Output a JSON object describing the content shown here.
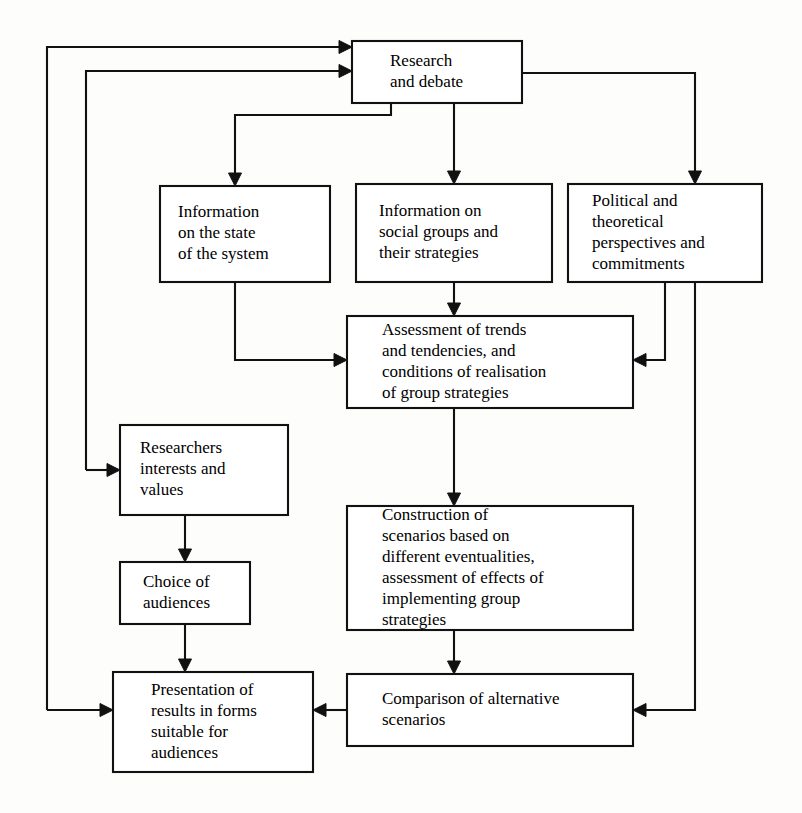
{
  "diagram": {
    "type": "flowchart",
    "background_color": "#fdfdfb",
    "line_color": "#111111",
    "box_fill_color": "#ffffff",
    "nodes": [
      {
        "id": "research",
        "name": "research-and-debate",
        "lines": [
          "Research",
          "and debate"
        ],
        "x": 352,
        "y": 41,
        "w": 170,
        "h": 62,
        "text_x": 390,
        "align": "start"
      },
      {
        "id": "info_state",
        "name": "information-on-state-of-system",
        "lines": [
          "Information",
          "on the state",
          "of the system"
        ],
        "x": 160,
        "y": 186,
        "w": 170,
        "h": 96,
        "text_x": 178,
        "align": "start"
      },
      {
        "id": "info_groups",
        "name": "information-on-social-groups",
        "lines": [
          "Information on",
          "social groups and",
          "their strategies"
        ],
        "x": 356,
        "y": 184,
        "w": 196,
        "h": 98,
        "text_x": 379,
        "align": "start"
      },
      {
        "id": "political",
        "name": "political-theoretical-perspectives",
        "lines": [
          "Political and",
          "theoretical",
          "perspectives and",
          "commitments"
        ],
        "x": 568,
        "y": 184,
        "w": 194,
        "h": 98,
        "text_x": 592,
        "align": "start"
      },
      {
        "id": "assessment",
        "name": "assessment-of-trends",
        "lines": [
          "Assessment of trends",
          "and tendencies, and",
          "conditions of realisation",
          "of group strategies"
        ],
        "x": 347,
        "y": 316,
        "w": 286,
        "h": 92,
        "text_x": 382,
        "align": "start"
      },
      {
        "id": "researchers",
        "name": "researchers-interests-and-values",
        "lines": [
          "Researchers",
          "interests and",
          "values"
        ],
        "x": 120,
        "y": 425,
        "w": 168,
        "h": 90,
        "text_x": 140,
        "align": "start"
      },
      {
        "id": "construction",
        "name": "construction-of-scenarios",
        "lines": [
          "Construction of",
          "scenarios based on",
          "different eventualities,",
          "assessment of effects of",
          "implementing group",
          "strategies"
        ],
        "x": 347,
        "y": 506,
        "w": 286,
        "h": 124,
        "text_x": 382,
        "align": "start"
      },
      {
        "id": "choice",
        "name": "choice-of-audiences",
        "lines": [
          "Choice of",
          "audiences"
        ],
        "x": 120,
        "y": 562,
        "w": 130,
        "h": 62,
        "text_x": 143,
        "align": "start"
      },
      {
        "id": "presentation",
        "name": "presentation-of-results",
        "lines": [
          "Presentation of",
          "results in forms",
          "suitable for",
          "audiences"
        ],
        "x": 113,
        "y": 672,
        "w": 200,
        "h": 100,
        "text_x": 151,
        "align": "start"
      },
      {
        "id": "comparison",
        "name": "comparison-of-alternative-scenarios",
        "lines": [
          "Comparison of alternative",
          "scenarios"
        ],
        "x": 347,
        "y": 674,
        "w": 286,
        "h": 72,
        "text_x": 382,
        "align": "start"
      }
    ],
    "edges": [
      {
        "name": "edge-research-to-info-state",
        "from": "research",
        "to": "info_state",
        "path": "M 391 103 L 391 115 L 235 115 L 235 178",
        "arrow": "down",
        "arrow_x": 235,
        "arrow_y": 186
      },
      {
        "name": "edge-research-to-info-groups",
        "from": "research",
        "to": "info_groups",
        "path": "M 454 103 L 454 176",
        "arrow": "down",
        "arrow_x": 454,
        "arrow_y": 184
      },
      {
        "name": "edge-research-to-political",
        "from": "research",
        "to": "political",
        "path": "M 522 73 L 695 73 L 695 176",
        "arrow": "down",
        "arrow_x": 695,
        "arrow_y": 184
      },
      {
        "name": "edge-info-groups-to-assessment",
        "from": "info_groups",
        "to": "assessment",
        "path": "M 454 282 L 454 308",
        "arrow": "down",
        "arrow_x": 454,
        "arrow_y": 316
      },
      {
        "name": "edge-info-state-to-assessment",
        "from": "info_state",
        "to": "assessment",
        "path": "M 235 282 L 235 360 L 339 360",
        "arrow": "right",
        "arrow_x": 347,
        "arrow_y": 360
      },
      {
        "name": "edge-political-to-assessment",
        "from": "political",
        "to": "assessment",
        "path": "M 665 282 L 665 360 L 641 360",
        "arrow": "left",
        "arrow_x": 633,
        "arrow_y": 360
      },
      {
        "name": "edge-assessment-to-construction",
        "from": "assessment",
        "to": "construction",
        "path": "M 454 408 L 454 498",
        "arrow": "down",
        "arrow_x": 454,
        "arrow_y": 506
      },
      {
        "name": "edge-construction-to-comparison",
        "from": "construction",
        "to": "comparison",
        "path": "M 454 630 L 454 666",
        "arrow": "down",
        "arrow_x": 454,
        "arrow_y": 674
      },
      {
        "name": "edge-comparison-to-presentation",
        "from": "comparison",
        "to": "presentation",
        "path": "M 347 710 L 321 710",
        "arrow": "left",
        "arrow_x": 313,
        "arrow_y": 710
      },
      {
        "name": "edge-political-to-comparison",
        "from": "political",
        "to": "comparison",
        "path": "M 695 282 L 695 710 L 641 710",
        "arrow": "left",
        "arrow_x": 633,
        "arrow_y": 710
      },
      {
        "name": "edge-researchers-to-choice",
        "from": "researchers",
        "to": "choice",
        "path": "M 185 515 L 185 554",
        "arrow": "down",
        "arrow_x": 185,
        "arrow_y": 562
      },
      {
        "name": "edge-choice-to-presentation",
        "from": "choice",
        "to": "presentation",
        "path": "M 185 624 L 185 664",
        "arrow": "down",
        "arrow_x": 185,
        "arrow_y": 672
      },
      {
        "name": "edge-feedback-presentation-to-research",
        "from": "presentation",
        "to": "research",
        "path": "M 47 710 L 47 47 L 344 47",
        "arrow": "right",
        "arrow_x": 352,
        "arrow_y": 47
      },
      {
        "name": "edge-feedback-presentation-inlet",
        "from": "feedback-left-outer",
        "to": "presentation",
        "path": "M 47 710 L 105 710",
        "arrow": "right",
        "arrow_x": 113,
        "arrow_y": 710
      },
      {
        "name": "edge-feedback-researchers-to-research",
        "from": "researchers",
        "to": "research",
        "path": "M 86 470 L 86 71 L 344 71",
        "arrow": "right",
        "arrow_x": 352,
        "arrow_y": 71
      },
      {
        "name": "edge-feedback-researchers-inlet",
        "from": "feedback-left-inner",
        "to": "researchers",
        "path": "M 86 470 L 112 470",
        "arrow": "right",
        "arrow_x": 120,
        "arrow_y": 470
      }
    ]
  }
}
